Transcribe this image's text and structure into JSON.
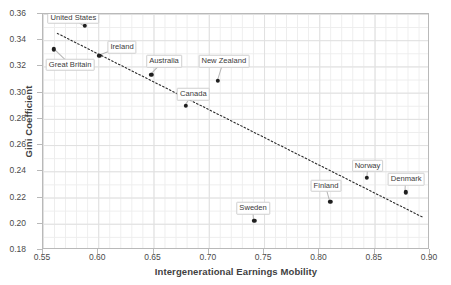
{
  "chart_data": {
    "type": "scatter",
    "title": "",
    "xlabel": "Intergenerational Earnings Mobility",
    "ylabel": "Gini Coefficient",
    "xlim": [
      0.55,
      0.9
    ],
    "ylim": [
      0.18,
      0.36
    ],
    "xticks": [
      "0.55",
      "0.60",
      "0.65",
      "0.70",
      "0.75",
      "0.80",
      "0.85",
      "0.90"
    ],
    "yticks": [
      "0.18",
      "0.20",
      "0.22",
      "0.24",
      "0.26",
      "0.28",
      "0.30",
      "0.32",
      "0.34",
      "0.36"
    ],
    "grid": true,
    "legend": "none",
    "marker_color": "#1f1f1f",
    "trendline": {
      "style": "dotted",
      "color": "#2b2b2b",
      "x_start": 0.563,
      "y_start": 0.3452,
      "x_end": 0.893,
      "y_end": 0.2052
    },
    "points": [
      {
        "label": "United States",
        "x": 0.588,
        "y": 0.351,
        "label_x": 0.5775,
        "label_y": 0.357
      },
      {
        "label": "Great Britain",
        "x": 0.56,
        "y": 0.333,
        "label_x": 0.5745,
        "label_y": 0.3213
      },
      {
        "label": "Ireland",
        "x": 0.601,
        "y": 0.328,
        "label_x": 0.6215,
        "label_y": 0.3345
      },
      {
        "label": "Australia",
        "x": 0.648,
        "y": 0.3138,
        "label_x": 0.6595,
        "label_y": 0.324
      },
      {
        "label": "New Zealand",
        "x": 0.708,
        "y": 0.309,
        "label_x": 0.7135,
        "label_y": 0.324
      },
      {
        "label": "Canada",
        "x": 0.679,
        "y": 0.2898,
        "label_x": 0.686,
        "label_y": 0.2988
      },
      {
        "label": "Sweden",
        "x": 0.741,
        "y": 0.2022,
        "label_x": 0.74,
        "label_y": 0.2118
      },
      {
        "label": "Finland",
        "x": 0.81,
        "y": 0.2168,
        "label_x": 0.806,
        "label_y": 0.229
      },
      {
        "label": "Norway",
        "x": 0.843,
        "y": 0.2352,
        "label_x": 0.8435,
        "label_y": 0.2442
      },
      {
        "label": "Denmark",
        "x": 0.878,
        "y": 0.224,
        "label_x": 0.8785,
        "label_y": 0.234
      }
    ]
  }
}
